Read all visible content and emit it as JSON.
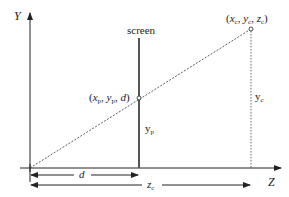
{
  "diagram": {
    "axes": {
      "vertical_label": "Y",
      "horizontal_label": "Z"
    },
    "screen_label": "screen",
    "points": {
      "projected": {
        "x": "x",
        "x_sub": "p",
        "y": "y",
        "y_sub": "p",
        "z": "d",
        "label_text": "(xp, yp, d)"
      },
      "camera": {
        "x": "x",
        "x_sub": "c",
        "y": "y",
        "y_sub": "c",
        "z": "z",
        "z_sub": "c",
        "label_text": "(xc, yc, zc)"
      }
    },
    "heights": {
      "screen_height": {
        "base": "y",
        "sub": "p"
      },
      "camera_height": {
        "base": "y",
        "sub": "c"
      }
    },
    "distances": {
      "screen_distance": "d",
      "camera_distance": {
        "base": "z",
        "sub": "c"
      }
    },
    "colors": {
      "line": "#222222",
      "screen": "#555555",
      "background": "#ffffff"
    }
  }
}
